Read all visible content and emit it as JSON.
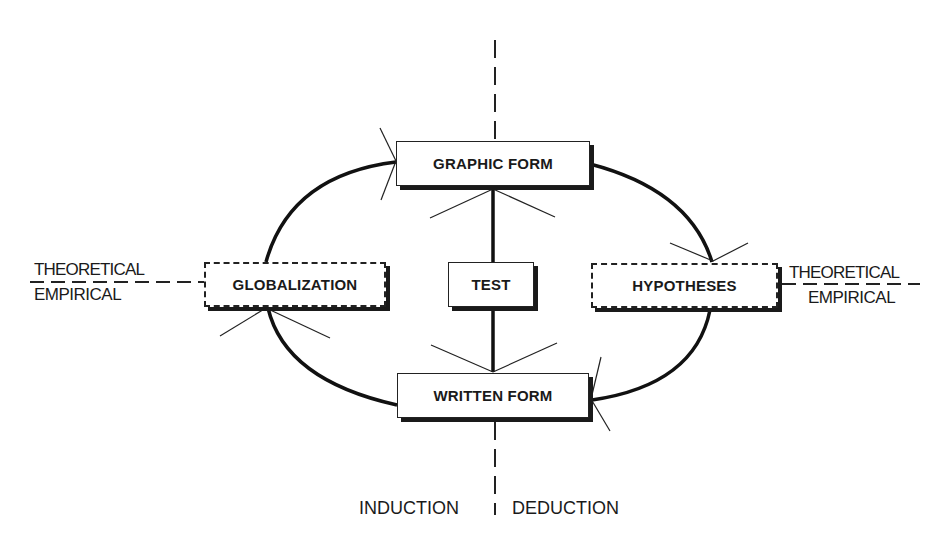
{
  "diagram": {
    "boxes": {
      "graphic_form": "GRAPHIC FORM",
      "written_form": "WRITTEN FORM",
      "test": "TEST",
      "globalization": "GLOBALIZATION",
      "hypotheses": "HYPOTHESES"
    },
    "left_axis": {
      "top": "THEORETICAL",
      "bottom": "EMPIRICAL"
    },
    "right_axis": {
      "top": "THEORETICAL",
      "bottom": "EMPIRICAL"
    },
    "bottom_labels": {
      "left": "INDUCTION",
      "right": "DEDUCTION"
    },
    "colors": {
      "ink": "#1a1a1a",
      "background": "#ffffff"
    }
  }
}
